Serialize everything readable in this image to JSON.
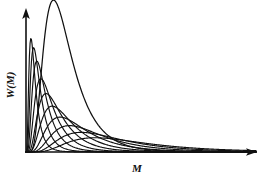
{
  "figure": {
    "title": "",
    "background_color": "#ffffff",
    "line_color": "#111111",
    "width": 269,
    "height": 180
  },
  "axes": {
    "x_label": "M",
    "y_label": "W(M)",
    "x_label_name": "molecular-weight",
    "y_label_name": "weight-fraction",
    "origin_x": 26,
    "origin_y": 152,
    "x_end": 256,
    "y_end": 10,
    "arrows": "both"
  },
  "chart_data": {
    "type": "line",
    "title": "",
    "xlabel": "M",
    "ylabel": "W(M)",
    "xlim": [
      0,
      1
    ],
    "ylim": [
      0,
      1
    ],
    "grid": false,
    "legend": false,
    "axis_ticks": "none",
    "series": [
      {
        "name": "peak-1",
        "peak_x": 0.048,
        "peak_y": 0.655,
        "width": 0.03,
        "skew": 1.55
      },
      {
        "name": "peak-2",
        "peak_x": 0.072,
        "peak_y": 0.605,
        "width": 0.038,
        "skew": 1.6
      },
      {
        "name": "peak-3",
        "peak_x": 0.1,
        "peak_y": 0.53,
        "width": 0.048,
        "skew": 1.65
      },
      {
        "name": "peak-4",
        "peak_x": 0.134,
        "peak_y": 0.43,
        "width": 0.06,
        "skew": 1.7
      },
      {
        "name": "peak-5",
        "peak_x": 0.176,
        "peak_y": 0.345,
        "width": 0.075,
        "skew": 1.75
      },
      {
        "name": "peak-6",
        "peak_x": 0.226,
        "peak_y": 0.272,
        "width": 0.094,
        "skew": 1.8
      },
      {
        "name": "peak-7",
        "peak_x": 0.288,
        "peak_y": 0.208,
        "width": 0.118,
        "skew": 1.85
      },
      {
        "name": "peak-8",
        "peak_x": 0.362,
        "peak_y": 0.158,
        "width": 0.146,
        "skew": 1.9
      },
      {
        "name": "peak-9",
        "peak_x": 0.452,
        "peak_y": 0.118,
        "width": 0.18,
        "skew": 1.95
      },
      {
        "name": "peak-10",
        "peak_x": 0.556,
        "peak_y": 0.086,
        "width": 0.22,
        "skew": 2.0
      },
      {
        "name": "envelope",
        "peak_x": 0.205,
        "peak_y": 0.935,
        "width": 0.215,
        "skew": 2.3
      }
    ]
  }
}
